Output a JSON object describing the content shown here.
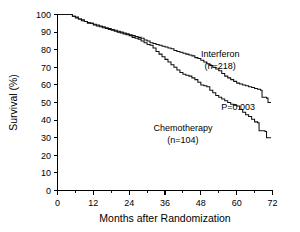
{
  "chart_data": {
    "type": "line",
    "title": "",
    "subtitle": "",
    "xlabel": "Months after Randomization",
    "ylabel": "Survival (%)",
    "xlim": [
      0,
      72
    ],
    "ylim": [
      0,
      100
    ],
    "xticks": [
      0,
      12,
      24,
      36,
      48,
      60,
      72
    ],
    "xtick_labels": [
      "0",
      "12",
      "24",
      "36",
      "48",
      "60",
      "72"
    ],
    "xminor_ticks": [
      6,
      18,
      30,
      42,
      54,
      66
    ],
    "yticks": [
      0,
      10,
      20,
      30,
      40,
      50,
      60,
      70,
      80,
      90,
      100
    ],
    "ytick_labels": [
      "0",
      "10",
      "20",
      "30",
      "40",
      "50",
      "60",
      "70",
      "80",
      "90",
      "100"
    ],
    "grid": false,
    "legend_position": "inline-annotation",
    "annotations": [
      {
        "id": "pvalue",
        "text": "P=0.003",
        "x": 60.5,
        "y": 46
      }
    ],
    "series": [
      {
        "name": "Interferon",
        "n_label": "(n=218)",
        "n": 218,
        "color": "#111111",
        "label_x": 54.5,
        "label_y": 76,
        "label_n_y": 69,
        "points": [
          [
            0,
            100
          ],
          [
            4,
            100
          ],
          [
            5,
            99
          ],
          [
            6,
            98.5
          ],
          [
            7,
            97.5
          ],
          [
            8,
            96.5
          ],
          [
            9,
            96
          ],
          [
            10,
            95.5
          ],
          [
            11,
            95
          ],
          [
            12,
            94.5
          ],
          [
            13,
            94
          ],
          [
            14,
            93.5
          ],
          [
            15,
            93
          ],
          [
            16,
            92.5
          ],
          [
            17,
            92
          ],
          [
            18,
            91.5
          ],
          [
            19,
            91
          ],
          [
            20,
            90.5
          ],
          [
            21,
            90
          ],
          [
            22,
            89.5
          ],
          [
            23,
            89
          ],
          [
            24,
            88.5
          ],
          [
            25,
            88
          ],
          [
            26,
            87.5
          ],
          [
            27,
            87
          ],
          [
            28,
            86.5
          ],
          [
            29,
            85.5
          ],
          [
            30,
            85
          ],
          [
            31,
            84
          ],
          [
            32,
            83.5
          ],
          [
            33,
            83
          ],
          [
            34,
            82.5
          ],
          [
            35,
            82
          ],
          [
            36,
            81.5
          ],
          [
            37,
            81
          ],
          [
            38,
            80.5
          ],
          [
            39,
            79.5
          ],
          [
            40,
            79
          ],
          [
            41,
            78.5
          ],
          [
            42,
            78
          ],
          [
            43,
            77.5
          ],
          [
            44,
            77
          ],
          [
            45,
            76.5
          ],
          [
            46,
            75.5
          ],
          [
            47,
            75
          ],
          [
            48,
            74
          ],
          [
            49,
            73
          ],
          [
            50,
            72
          ],
          [
            51,
            71
          ],
          [
            52,
            70
          ],
          [
            53,
            69
          ],
          [
            54,
            68
          ],
          [
            55,
            66.5
          ],
          [
            56,
            65
          ],
          [
            57,
            64
          ],
          [
            58,
            63
          ],
          [
            59,
            62
          ],
          [
            60,
            61
          ],
          [
            61,
            60.5
          ],
          [
            62,
            60
          ],
          [
            63,
            59.5
          ],
          [
            64,
            59
          ],
          [
            65,
            58.5
          ],
          [
            66,
            58
          ],
          [
            67,
            57.5
          ],
          [
            68,
            57
          ],
          [
            68.5,
            53
          ],
          [
            70,
            52.5
          ],
          [
            70.5,
            50
          ],
          [
            71.5,
            50
          ]
        ]
      },
      {
        "name": "Chemotherapy",
        "n_label": "(n=104)",
        "n": 104,
        "color": "#111111",
        "label_x": 42,
        "label_y": 34,
        "label_n_y": 27,
        "points": [
          [
            0,
            100
          ],
          [
            4,
            100
          ],
          [
            5,
            99
          ],
          [
            6,
            98
          ],
          [
            7,
            97.5
          ],
          [
            8,
            97
          ],
          [
            9,
            96
          ],
          [
            10,
            95
          ],
          [
            11,
            95
          ],
          [
            12,
            94
          ],
          [
            13,
            93.5
          ],
          [
            14,
            93
          ],
          [
            15,
            92.5
          ],
          [
            16,
            92
          ],
          [
            17,
            91.5
          ],
          [
            18,
            91
          ],
          [
            19,
            90.5
          ],
          [
            20,
            90
          ],
          [
            21,
            89.5
          ],
          [
            22,
            89
          ],
          [
            23,
            88.5
          ],
          [
            24,
            88
          ],
          [
            25,
            87
          ],
          [
            26,
            86.5
          ],
          [
            27,
            86
          ],
          [
            28,
            85
          ],
          [
            29,
            84
          ],
          [
            30,
            83
          ],
          [
            31,
            82.5
          ],
          [
            32,
            81
          ],
          [
            33,
            79
          ],
          [
            34,
            77.5
          ],
          [
            35,
            76
          ],
          [
            36,
            74.5
          ],
          [
            37,
            73
          ],
          [
            38,
            71.5
          ],
          [
            39,
            70
          ],
          [
            40,
            68.5
          ],
          [
            41,
            67
          ],
          [
            42,
            66
          ],
          [
            43,
            65.5
          ],
          [
            44,
            65
          ],
          [
            45,
            64
          ],
          [
            46,
            63
          ],
          [
            47,
            61.5
          ],
          [
            48,
            60
          ],
          [
            49,
            59.5
          ],
          [
            50,
            59
          ],
          [
            51,
            57
          ],
          [
            52,
            55.5
          ],
          [
            53,
            54
          ],
          [
            54,
            53
          ],
          [
            55,
            52
          ],
          [
            56,
            51
          ],
          [
            57,
            50
          ],
          [
            58,
            49
          ],
          [
            59,
            48.5
          ],
          [
            60,
            48
          ],
          [
            61,
            46
          ],
          [
            62,
            44.5
          ],
          [
            63,
            43
          ],
          [
            64,
            42
          ],
          [
            65,
            40.5
          ],
          [
            66,
            39
          ],
          [
            67,
            38.5
          ],
          [
            67.5,
            34
          ],
          [
            69.5,
            33.5
          ],
          [
            70,
            30
          ],
          [
            71.5,
            30
          ]
        ]
      }
    ]
  }
}
